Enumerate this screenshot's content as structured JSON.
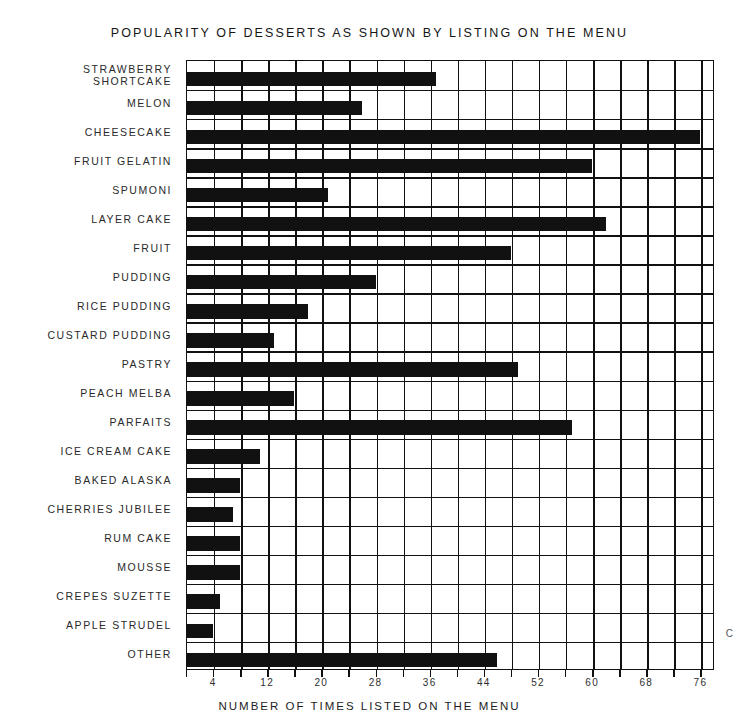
{
  "chart_data": {
    "type": "bar",
    "orientation": "horizontal",
    "title": "POPULARITY OF DESSERTS AS SHOWN BY LISTING ON THE MENU",
    "xlabel": "NUMBER OF TIMES LISTED ON THE MENU",
    "ylabel": "",
    "xlim": [
      0,
      78
    ],
    "xticks": [
      4,
      12,
      20,
      28,
      36,
      44,
      52,
      60,
      68,
      76
    ],
    "gridline_step": 4,
    "grid": true,
    "legend": null,
    "bar_color": "#111111",
    "background_color": "#ffffff",
    "categories": [
      "STRAWBERRY SHORTCAKE",
      "MELON",
      "CHEESECAKE",
      "FRUIT GELATIN",
      "SPUMONI",
      "LAYER CAKE",
      "FRUIT",
      "PUDDING",
      "RICE PUDDING",
      "CUSTARD PUDDING",
      "PASTRY",
      "PEACH MELBA",
      "PARFAITS",
      "ICE CREAM CAKE",
      "BAKED ALASKA",
      "CHERRIES JUBILEE",
      "RUM CAKE",
      "MOUSSE",
      "CREPES SUZETTE",
      "APPLE STRUDEL",
      "OTHER"
    ],
    "values": [
      37,
      26,
      76,
      60,
      21,
      62,
      48,
      28,
      18,
      13,
      49,
      16,
      57,
      11,
      8,
      7,
      8,
      8,
      5,
      4,
      46
    ]
  },
  "labels": [
    {
      "line1": "STRAWBERRY",
      "line2": "SHORTCAKE"
    },
    {
      "line1": "MELON",
      "line2": ""
    },
    {
      "line1": "CHEESECAKE",
      "line2": ""
    },
    {
      "line1": "FRUIT GELATIN",
      "line2": ""
    },
    {
      "line1": "SPUMONI",
      "line2": ""
    },
    {
      "line1": "LAYER CAKE",
      "line2": ""
    },
    {
      "line1": "FRUIT",
      "line2": ""
    },
    {
      "line1": "PUDDING",
      "line2": ""
    },
    {
      "line1": "RICE PUDDING",
      "line2": ""
    },
    {
      "line1": "CUSTARD PUDDING",
      "line2": ""
    },
    {
      "line1": "PASTRY",
      "line2": ""
    },
    {
      "line1": "PEACH MELBA",
      "line2": ""
    },
    {
      "line1": "PARFAITS",
      "line2": ""
    },
    {
      "line1": "ICE CREAM CAKE",
      "line2": ""
    },
    {
      "line1": "BAKED ALASKA",
      "line2": ""
    },
    {
      "line1": "CHERRIES JUBILEE",
      "line2": ""
    },
    {
      "line1": "RUM CAKE",
      "line2": ""
    },
    {
      "line1": "MOUSSE",
      "line2": ""
    },
    {
      "line1": "CREPES SUZETTE",
      "line2": ""
    },
    {
      "line1": "APPLE STRUDEL",
      "line2": ""
    },
    {
      "line1": "OTHER",
      "line2": ""
    }
  ],
  "marks": {
    "corner_letter": "C"
  }
}
